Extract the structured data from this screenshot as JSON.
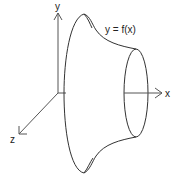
{
  "diagram": {
    "labels": {
      "y_axis": "y",
      "x_axis": "x",
      "z_axis": "z",
      "curve": "y = f(x)"
    },
    "colors": {
      "stroke": "#333333",
      "axis": "#555555",
      "background": "#ffffff"
    }
  }
}
